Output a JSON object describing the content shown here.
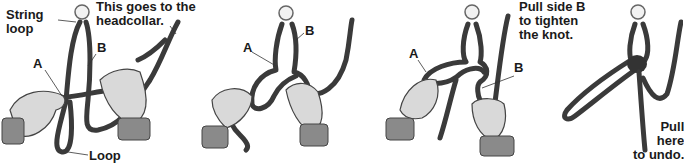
{
  "panels": [
    {
      "step": 1,
      "labels": {
        "string_loop": "String\nloop",
        "headcollar": "This goes to the\nheadcollar.",
        "a": "A",
        "b": "B",
        "loop": "Loop"
      }
    },
    {
      "step": 2,
      "labels": {
        "a": "A",
        "b": "B"
      }
    },
    {
      "step": 3,
      "labels": {
        "a": "A",
        "b": "B",
        "instruction": "Pull side B\nto tighten\nthe knot."
      }
    },
    {
      "step": 4,
      "labels": {
        "instruction": "Pull\nhere\nto undo."
      }
    }
  ],
  "colors": {
    "rope": "#3a3a3a",
    "hand": "#d9d9d9",
    "cuff": "#8a8a8a",
    "background": "#ffffff"
  }
}
